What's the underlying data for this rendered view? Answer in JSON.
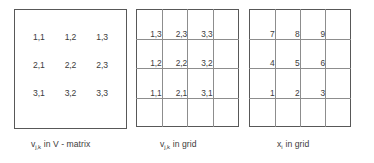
{
  "figure": {
    "background_color": "#ffffff",
    "text_color": "#3c3c3c",
    "frame_color": "#585858",
    "gridline_color": "#8d8d8d"
  },
  "panels": [
    {
      "id": "matrix",
      "type": "matrix-box",
      "caption": {
        "variable": "v",
        "subscript": "j,k",
        "rest": "in V - matrix",
        "full_text": "v j,k in V - matrix"
      },
      "rows": [
        [
          "1,1",
          "1,2",
          "1,3"
        ],
        [
          "2,1",
          "2,2",
          "2,3"
        ],
        [
          "3,1",
          "3,2",
          "3,3"
        ]
      ]
    },
    {
      "id": "vgrid",
      "type": "grid-nodes",
      "caption": {
        "variable": "v",
        "subscript": "j,k",
        "rest": "in grid",
        "full_text": "v j,k in grid"
      },
      "grid": {
        "columns": 4,
        "rows": 4
      },
      "node_rows": [
        [
          "1,3",
          "2,3",
          "3,3"
        ],
        [
          "1,2",
          "2,2",
          "3,2"
        ],
        [
          "1,1",
          "2,1",
          "3,1"
        ]
      ]
    },
    {
      "id": "xgrid",
      "type": "grid-nodes",
      "caption": {
        "variable": "x",
        "subscript": "i",
        "rest": "in grid",
        "full_text": "x i in grid"
      },
      "grid": {
        "columns": 4,
        "rows": 4
      },
      "node_rows": [
        [
          "7",
          "8",
          "9"
        ],
        [
          "4",
          "5",
          "6"
        ],
        [
          "1",
          "2",
          "3"
        ]
      ]
    }
  ]
}
